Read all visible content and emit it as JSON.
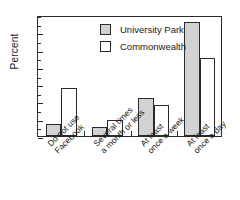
{
  "chart_data": {
    "type": "bar",
    "title": "",
    "xlabel": "",
    "ylabel": "Percent",
    "ylim": [
      0,
      70
    ],
    "ytick_values": [
      0,
      10,
      20,
      30,
      40,
      50,
      60
    ],
    "ytick_labels": [
      "0",
      "10",
      "20",
      "30",
      "40",
      "50",
      "60"
    ],
    "y_minor_tick_step": 5,
    "grid": false,
    "legend_position": "upper center inside plot",
    "categories": [
      "Do not use Facebook",
      "Several times a month or less",
      "At least once a week",
      "At least once a day"
    ],
    "category_lines": [
      [
        "Do not use",
        "Facebook"
      ],
      [
        "Several times",
        "a month or less"
      ],
      [
        "At least",
        "once a week"
      ],
      [
        "At least",
        "once a day"
      ]
    ],
    "series": [
      {
        "name": "University Park",
        "color": "#d2d2d2",
        "edge_color": "#2b2b2b",
        "values": [
          7,
          5.5,
          22,
          66
        ]
      },
      {
        "name": "Commonwealth",
        "color": "#ffffff",
        "edge_color": "#2b2b2b",
        "values": [
          28,
          9,
          18,
          45
        ]
      }
    ]
  },
  "legend": {
    "entries": [
      {
        "label": "University Park"
      },
      {
        "label": "Commonwealth"
      }
    ]
  },
  "axes": {
    "y_title": "Percent"
  }
}
